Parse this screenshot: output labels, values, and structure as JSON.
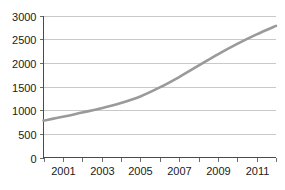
{
  "chart_data": {
    "type": "line",
    "title": "",
    "subtitle": "",
    "xlabel": "",
    "ylabel": "",
    "x": [
      2000,
      2001,
      2002,
      2003,
      2004,
      2005,
      2006,
      2007,
      2008,
      2009,
      2010,
      2011,
      2012
    ],
    "values": [
      780,
      860,
      950,
      1040,
      1150,
      1290,
      1480,
      1700,
      1940,
      2180,
      2400,
      2600,
      2780
    ],
    "series": [
      {
        "name": "",
        "values": [
          780,
          860,
          950,
          1040,
          1150,
          1290,
          1480,
          1700,
          1940,
          2180,
          2400,
          2600,
          2780
        ]
      }
    ],
    "xlim": [
      2000,
      2012
    ],
    "ylim": [
      0,
      3000
    ],
    "y_ticks": [
      0,
      500,
      1000,
      1500,
      2000,
      2500,
      3000
    ],
    "y_tick_labels": [
      "0",
      "500",
      "1000",
      "1500",
      "2000",
      "2500",
      "3000"
    ],
    "x_ticks": [
      2000,
      2001,
      2002,
      2003,
      2004,
      2005,
      2006,
      2007,
      2008,
      2009,
      2010,
      2011,
      2012
    ],
    "x_tick_labels": [
      "",
      "2001",
      "",
      "2003",
      "",
      "2005",
      "",
      "2007",
      "",
      "2009",
      "",
      "2011",
      ""
    ],
    "grid": true,
    "grid_axis": "y",
    "legend": false,
    "legend_position": "none",
    "line_color": "#9a9a9a",
    "grid_color": "#c9c9c9",
    "axis_color": "#4a4a4a",
    "text_color": "#1a1a1a",
    "background_color": "#ffffff"
  }
}
